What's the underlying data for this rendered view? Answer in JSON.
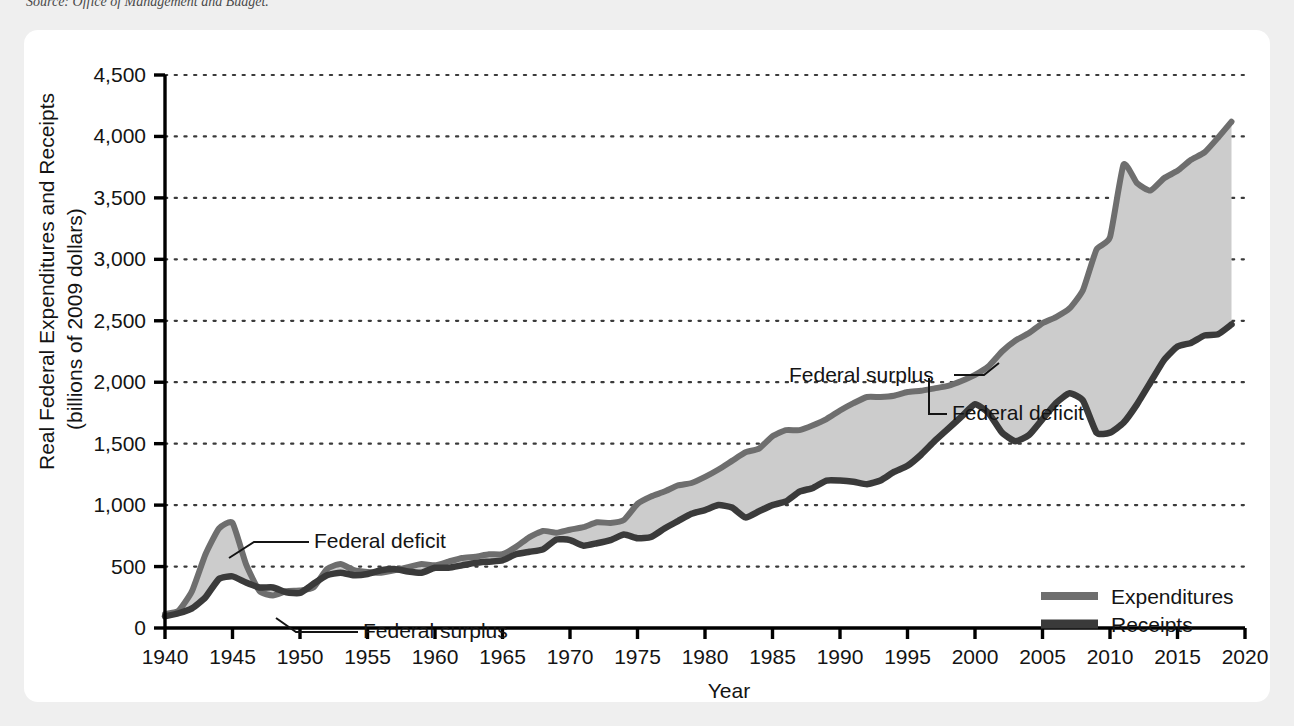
{
  "source_note": "Source: Office of Management and Budget.",
  "chart_data": {
    "type": "area",
    "title": "",
    "xlabel": "Year",
    "ylabel": "Real Federal Expenditures and Receipts",
    "ylabel_line2": "(billions of 2009 dollars)",
    "xlim": [
      1940,
      2020
    ],
    "ylim": [
      0,
      4500
    ],
    "xticks": [
      1940,
      1945,
      1950,
      1955,
      1960,
      1965,
      1970,
      1975,
      1980,
      1985,
      1990,
      1995,
      2000,
      2005,
      2010,
      2015,
      2020
    ],
    "yticks": [
      0,
      500,
      1000,
      1500,
      2000,
      2500,
      3000,
      3500,
      4000,
      4500
    ],
    "ytick_labels": [
      "0",
      "500",
      "1,000",
      "1,500",
      "2,000",
      "2,500",
      "3,000",
      "3,500",
      "4,000",
      "4,500"
    ],
    "xtick_labels": [
      "1940",
      "1945",
      "1950",
      "1955",
      "1960",
      "1965",
      "1970",
      "1975",
      "1980",
      "1985",
      "1990",
      "1995",
      "2000",
      "2005",
      "2010",
      "2015",
      "2020"
    ],
    "grid": "horizontal-dotted",
    "legend_position": "bottom-right",
    "x": [
      1940,
      1941,
      1942,
      1943,
      1944,
      1945,
      1946,
      1947,
      1948,
      1949,
      1950,
      1951,
      1952,
      1953,
      1954,
      1955,
      1956,
      1957,
      1958,
      1959,
      1960,
      1961,
      1962,
      1963,
      1964,
      1965,
      1966,
      1967,
      1968,
      1969,
      1970,
      1971,
      1972,
      1973,
      1974,
      1975,
      1976,
      1977,
      1978,
      1979,
      1980,
      1981,
      1982,
      1983,
      1984,
      1985,
      1986,
      1987,
      1988,
      1989,
      1990,
      1991,
      1992,
      1993,
      1994,
      1995,
      1996,
      1997,
      1998,
      1999,
      2000,
      2001,
      2002,
      2003,
      2004,
      2005,
      2006,
      2007,
      2008,
      2009,
      2010,
      2011,
      2012,
      2013,
      2014,
      2015,
      2016,
      2017,
      2018,
      2019
    ],
    "series": [
      {
        "name": "Expenditures",
        "color": "#6e6e6e",
        "values": [
          115,
          140,
          300,
          600,
          810,
          855,
          520,
          300,
          265,
          300,
          305,
          330,
          480,
          520,
          470,
          455,
          450,
          470,
          495,
          520,
          510,
          540,
          570,
          580,
          600,
          600,
          660,
          740,
          790,
          775,
          800,
          820,
          860,
          855,
          880,
          1010,
          1070,
          1110,
          1160,
          1180,
          1230,
          1290,
          1360,
          1430,
          1460,
          1560,
          1610,
          1610,
          1650,
          1700,
          1770,
          1830,
          1880,
          1880,
          1890,
          1920,
          1930,
          1950,
          1970,
          2010,
          2060,
          2130,
          2250,
          2340,
          2400,
          2480,
          2530,
          2600,
          2750,
          3080,
          3180,
          3770,
          3620,
          3560,
          3660,
          3720,
          3810,
          3870,
          3990,
          4120
        ]
      },
      {
        "name": "Receipts",
        "color": "#3a3a3a",
        "values": [
          95,
          120,
          160,
          250,
          400,
          420,
          370,
          330,
          330,
          290,
          285,
          360,
          430,
          450,
          430,
          440,
          470,
          480,
          460,
          450,
          490,
          490,
          510,
          530,
          540,
          550,
          600,
          620,
          640,
          720,
          715,
          670,
          690,
          715,
          760,
          730,
          740,
          810,
          870,
          930,
          960,
          1000,
          980,
          900,
          950,
          1000,
          1030,
          1110,
          1140,
          1200,
          1200,
          1190,
          1170,
          1200,
          1270,
          1320,
          1410,
          1520,
          1620,
          1720,
          1820,
          1750,
          1590,
          1520,
          1570,
          1700,
          1830,
          1910,
          1850,
          1590,
          1590,
          1670,
          1820,
          2000,
          2180,
          2290,
          2320,
          2380,
          2390,
          2470
        ]
      }
    ],
    "annotations": [
      {
        "label": "Federal deficit",
        "at_year": 1944,
        "note": "WWII gap between expenditures and receipts"
      },
      {
        "label": "Federal surplus",
        "at_year": 1948,
        "note": "postwar receipts above expenditures"
      },
      {
        "label": "Federal surplus",
        "at_year": 2000,
        "note": "late-1990s budget surplus"
      },
      {
        "label": "Federal deficit",
        "at_year": 2003,
        "note": "early-2000s return to deficit"
      }
    ]
  },
  "legend": {
    "items": [
      {
        "label": "Expenditures",
        "color": "#6e6e6e"
      },
      {
        "label": "Receipts",
        "color": "#3a3a3a"
      }
    ]
  },
  "colors": {
    "page_background": "#efefef",
    "card_background": "#ffffff",
    "fill_between": "#cccccc",
    "axis": "#000000",
    "grid": "#3a3a3a",
    "text": "#141414"
  }
}
